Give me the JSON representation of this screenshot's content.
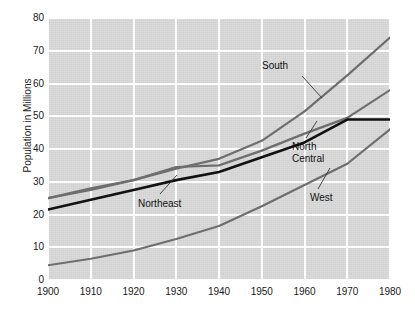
{
  "chart_data": {
    "type": "line",
    "title": "",
    "xlabel": "",
    "ylabel": "Population in Millions",
    "xlim": [
      1900,
      1980
    ],
    "ylim": [
      0,
      80
    ],
    "grid": true,
    "legend_position": "inline-annotations",
    "x": [
      1900,
      1910,
      1920,
      1930,
      1940,
      1950,
      1960,
      1970,
      1980
    ],
    "xticks": [
      "1900",
      "1910",
      "1920",
      "1930",
      "1940",
      "1950",
      "1960",
      "1970",
      "1980"
    ],
    "yticks": [
      "0",
      "10",
      "20",
      "30",
      "40",
      "50",
      "60",
      "70",
      "80"
    ],
    "series": [
      {
        "name": "South",
        "color": "#6e6e6e",
        "values": [
          25.0,
          28.0,
          30.5,
          34.0,
          37.0,
          42.5,
          51.5,
          62.5,
          74.0
        ]
      },
      {
        "name": "Northeast",
        "color": "#6e6e6e",
        "values": [
          25.0,
          27.5,
          30.5,
          34.5,
          35.0,
          39.5,
          44.7,
          49.5,
          58.0
        ]
      },
      {
        "name": "North Central",
        "color": "#111111",
        "values": [
          21.5,
          24.5,
          27.5,
          30.5,
          33.0,
          37.5,
          42.0,
          49.0,
          49.0
        ]
      },
      {
        "name": "West",
        "color": "#6e6e6e",
        "values": [
          4.5,
          6.5,
          9.0,
          12.5,
          16.5,
          22.5,
          29.0,
          35.5,
          46.0
        ]
      }
    ],
    "annotations": [
      {
        "label": "South",
        "x": 262,
        "y": 60,
        "leader": [
          302,
          76,
          322,
          98
        ]
      },
      {
        "label": "North\nCentral",
        "x": 292,
        "y": 141,
        "leader": [
          306,
          138,
          317,
          121
        ]
      },
      {
        "label": "Northeast",
        "x": 138,
        "y": 198,
        "leader": [
          160,
          194,
          177,
          175
        ]
      },
      {
        "label": "West",
        "x": 310,
        "y": 192,
        "leader": [
          318,
          189,
          330,
          168
        ]
      }
    ],
    "colors": {
      "plot_background": "#d9d9d9",
      "gridline": "#ffffff",
      "page_background": "#ffffff",
      "text": "#1a1a1a",
      "series_gray": "#6e6e6e",
      "series_black": "#111111"
    }
  }
}
